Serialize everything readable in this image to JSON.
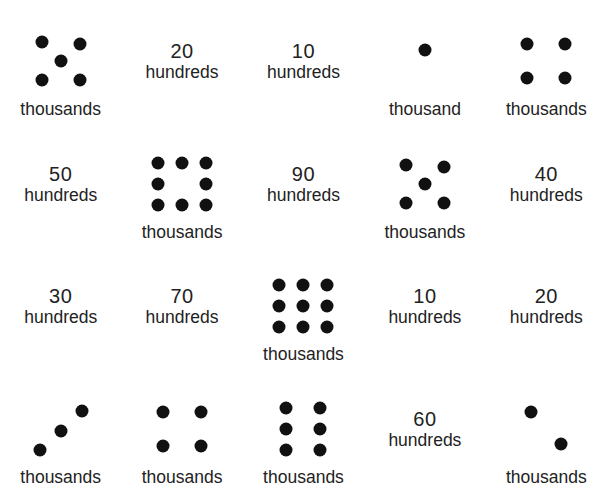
{
  "page": {
    "background_color": "#ffffff",
    "dot_color": "#111111",
    "text_color": "#222222",
    "columns": 5,
    "rows": 4
  },
  "labels": {
    "thousands": "thousands",
    "thousand": "thousand",
    "hundreds": "hundreds"
  },
  "cells": [
    {
      "id": "r1c1",
      "kind": "dots",
      "dot_count": 5,
      "pattern": "quincunx-5",
      "dots": [
        [
          18,
          14
        ],
        [
          56,
          16
        ],
        [
          37,
          33
        ],
        [
          18,
          52
        ],
        [
          56,
          52
        ]
      ],
      "unit": "thousands"
    },
    {
      "id": "r1c2",
      "kind": "value",
      "number": "20",
      "unit": "hundreds"
    },
    {
      "id": "r1c3",
      "kind": "value",
      "number": "10",
      "unit": "hundreds"
    },
    {
      "id": "r1c4",
      "kind": "dots",
      "dot_count": 1,
      "pattern": "single",
      "dots": [
        [
          37,
          22
        ]
      ],
      "unit": "thousand"
    },
    {
      "id": "r1c5",
      "kind": "dots",
      "dot_count": 4,
      "pattern": "square-4",
      "dots": [
        [
          18,
          16
        ],
        [
          56,
          16
        ],
        [
          18,
          50
        ],
        [
          56,
          50
        ]
      ],
      "unit": "thousands"
    },
    {
      "id": "r2c1",
      "kind": "value",
      "number": "50",
      "unit": "hundreds"
    },
    {
      "id": "r2c2",
      "kind": "dots",
      "dot_count": 8,
      "pattern": "ring-8",
      "dots": [
        [
          13,
          12
        ],
        [
          37,
          12
        ],
        [
          61,
          12
        ],
        [
          13,
          33
        ],
        [
          61,
          33
        ],
        [
          13,
          54
        ],
        [
          37,
          54
        ],
        [
          61,
          54
        ]
      ],
      "unit": "thousands"
    },
    {
      "id": "r2c3",
      "kind": "value",
      "number": "90",
      "unit": "hundreds"
    },
    {
      "id": "r2c4",
      "kind": "dots",
      "dot_count": 5,
      "pattern": "quincunx-5",
      "dots": [
        [
          18,
          14
        ],
        [
          56,
          16
        ],
        [
          37,
          33
        ],
        [
          18,
          52
        ],
        [
          56,
          52
        ]
      ],
      "unit": "thousands"
    },
    {
      "id": "r2c5",
      "kind": "value",
      "number": "40",
      "unit": "hundreds"
    },
    {
      "id": "r3c1",
      "kind": "value",
      "number": "30",
      "unit": "hundreds"
    },
    {
      "id": "r3c2",
      "kind": "value",
      "number": "70",
      "unit": "hundreds"
    },
    {
      "id": "r3c3",
      "kind": "dots",
      "dot_count": 9,
      "pattern": "grid-9",
      "dots": [
        [
          13,
          12
        ],
        [
          37,
          12
        ],
        [
          61,
          12
        ],
        [
          13,
          33
        ],
        [
          37,
          33
        ],
        [
          61,
          33
        ],
        [
          13,
          54
        ],
        [
          37,
          54
        ],
        [
          61,
          54
        ]
      ],
      "unit": "thousands"
    },
    {
      "id": "r3c4",
      "kind": "value",
      "number": "10",
      "unit": "hundreds"
    },
    {
      "id": "r3c5",
      "kind": "value",
      "number": "20",
      "unit": "hundreds"
    },
    {
      "id": "r4c1",
      "kind": "dots",
      "dot_count": 3,
      "pattern": "diagonal-3",
      "dots": [
        [
          16,
          54
        ],
        [
          37,
          35
        ],
        [
          58,
          15
        ]
      ],
      "unit": "thousands"
    },
    {
      "id": "r4c2",
      "kind": "dots",
      "dot_count": 4,
      "pattern": "square-4",
      "dots": [
        [
          18,
          16
        ],
        [
          56,
          16
        ],
        [
          18,
          50
        ],
        [
          56,
          50
        ]
      ],
      "unit": "thousands"
    },
    {
      "id": "r4c3",
      "kind": "dots",
      "dot_count": 6,
      "pattern": "two-columns-6",
      "dots": [
        [
          20,
          12
        ],
        [
          54,
          12
        ],
        [
          20,
          33
        ],
        [
          54,
          33
        ],
        [
          20,
          54
        ],
        [
          54,
          54
        ]
      ],
      "unit": "thousands"
    },
    {
      "id": "r4c4",
      "kind": "value",
      "number": "60",
      "unit": "hundreds"
    },
    {
      "id": "r4c5",
      "kind": "dots",
      "dot_count": 2,
      "pattern": "diagonal-2",
      "dots": [
        [
          22,
          16
        ],
        [
          52,
          48
        ]
      ],
      "unit": "thousands"
    }
  ]
}
